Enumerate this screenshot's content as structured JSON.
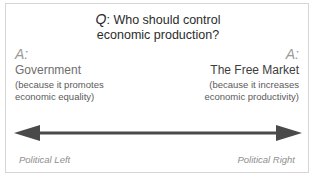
{
  "question": {
    "marker": "Q",
    "colon": ":",
    "line1": "Who should control",
    "line2": "economic production?"
  },
  "left_answer": {
    "marker": "A:",
    "title": "Government",
    "reason_line1": "(because it promotes",
    "reason_line2": "economic equality)",
    "pole_label": "Political Left"
  },
  "right_answer": {
    "marker": "A:",
    "title": "The Free Market",
    "reason_line1": "(because it increases",
    "reason_line2": "economic productivity)",
    "pole_label": "Political Right"
  },
  "arrow": {
    "name": "double-headed-spectrum-arrow",
    "color": "#4a4a4a",
    "direction": "bidirectional"
  },
  "colors": {
    "frame_border": "#d6d6d6",
    "background": "#ffffff",
    "question_text": "#2b2b2b",
    "marker_gray": "#9a9a9a",
    "pole_label_gray": "#8f8f8f",
    "arrow_gray": "#4a4a4a"
  }
}
